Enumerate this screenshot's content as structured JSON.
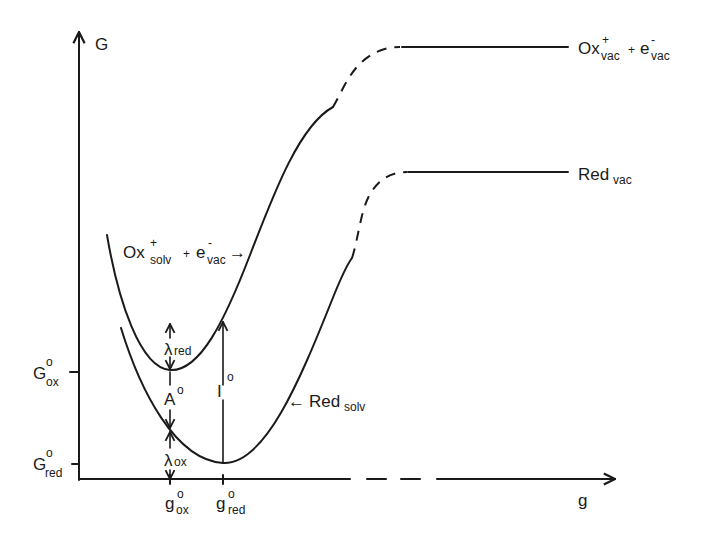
{
  "diagram": {
    "axes": {
      "y_label": "G",
      "x_label": "g",
      "y_ticks": [
        {
          "main": "G",
          "sup": "o",
          "sub": "ox"
        },
        {
          "main": "G",
          "sup": "o",
          "sub": "red"
        }
      ],
      "x_ticks": [
        {
          "main": "g",
          "sup": "o",
          "sub": "ox"
        },
        {
          "main": "g",
          "sup": "o",
          "sub": "red"
        }
      ]
    },
    "curves": {
      "ox_solv": {
        "main": "Ox",
        "sup": "+",
        "sub": "solv",
        "plus": "+",
        "e_main": "e",
        "e_sup": "-",
        "e_sub": "vac",
        "arrow": "→"
      },
      "red_solv": {
        "arrow": "←",
        "main": "Red",
        "sub": "solv"
      },
      "ox_vac": {
        "main": "Ox",
        "sup": "+",
        "sub": "vac",
        "plus": "+",
        "e_main": "e",
        "e_sup": "-",
        "e_sub": "vac"
      },
      "red_vac": {
        "main": "Red",
        "sub": "vac"
      }
    },
    "annotations": {
      "lambda_red": {
        "main": "λ",
        "sub": "red"
      },
      "A0": {
        "main": "A",
        "sup": "o"
      },
      "I0": {
        "main": "I",
        "sup": "o"
      },
      "lambda_ox": {
        "main": "λ",
        "sub": "ox"
      }
    },
    "colors": {
      "ink": "#1a1a1a",
      "background": "#ffffff"
    }
  }
}
